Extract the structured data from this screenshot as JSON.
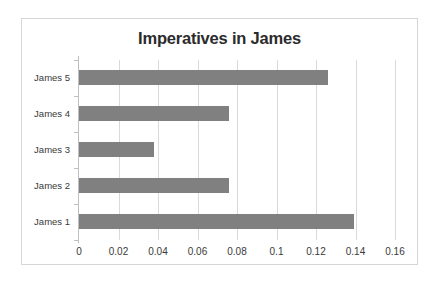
{
  "chart_data": {
    "type": "bar",
    "orientation": "horizontal",
    "title": "Imperatives in James",
    "xlabel": "",
    "ylabel": "",
    "categories": [
      "James 1",
      "James 2",
      "James 3",
      "James 4",
      "James 5"
    ],
    "values": [
      0.139,
      0.0757,
      0.038,
      0.0757,
      0.126
    ],
    "xlim": [
      0,
      0.16
    ],
    "xticks": [
      0,
      0.02,
      0.04,
      0.06,
      0.08,
      0.1,
      0.12,
      0.14,
      0.16
    ],
    "xtick_labels": [
      "0",
      "0.02",
      "0.04",
      "0.06",
      "0.08",
      "0.1",
      "0.12",
      "0.14",
      "0.16"
    ],
    "grid": "vertical",
    "legend": null,
    "bar_color": "#808080",
    "gridline_color": "#d9d9d9",
    "axis_color": "#bfbfbf",
    "plot_background": "#ffffff",
    "border_color": "#d6d6d6",
    "title_color": "#2b2b2b",
    "label_color": "#3a3a3a"
  }
}
